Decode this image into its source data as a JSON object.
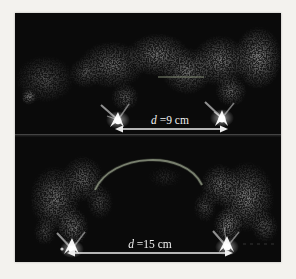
{
  "figure": {
    "colors": {
      "page_background": "#f3f2ee",
      "panel_background": "#0a0a0a",
      "annotation": "#f0f0f0",
      "arc_overlay": "#8f9783",
      "faint_line": "#7e8671",
      "divider": "#565656"
    },
    "icons": {
      "measurement_arrow": "double-headed-arrow",
      "discharge_arc": "curved-arc-overlay"
    },
    "panels": [
      {
        "name": "top-panel-d9",
        "label": {
          "symbol": "d",
          "rest": "=9 cm",
          "full": "d=9 cm"
        }
      },
      {
        "name": "bottom-panel-d15",
        "label": {
          "symbol": "d",
          "rest": "=15 cm",
          "full": "d=15 cm"
        }
      }
    ]
  }
}
